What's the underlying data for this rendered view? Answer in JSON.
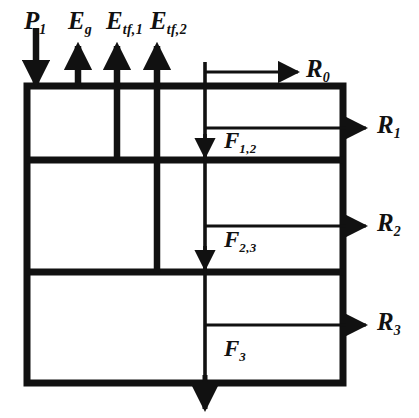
{
  "figure": {
    "type": "energy-balance-block-diagram",
    "stroke_color": "#111111",
    "background_color": "#ffffff"
  },
  "inputs": {
    "items": [
      {
        "id": "p1",
        "base": "P",
        "sub": "1",
        "direction": "down",
        "weight": "thick"
      },
      {
        "id": "eg",
        "base": "E",
        "sub": "g",
        "direction": "up",
        "weight": "thick"
      },
      {
        "id": "etf1",
        "base": "E",
        "sub": "tf,1",
        "direction": "up",
        "weight": "thick"
      },
      {
        "id": "etf2",
        "base": "E",
        "sub": "tf,2",
        "direction": "up",
        "weight": "thick"
      }
    ]
  },
  "outputs": {
    "items": [
      {
        "id": "r0",
        "base": "R",
        "sub": "0",
        "direction": "right"
      },
      {
        "id": "r1",
        "base": "R",
        "sub": "1",
        "direction": "right"
      },
      {
        "id": "r2",
        "base": "R",
        "sub": "2",
        "direction": "right"
      },
      {
        "id": "r3",
        "base": "R",
        "sub": "3",
        "direction": "right"
      }
    ]
  },
  "internal_fluxes": {
    "items": [
      {
        "id": "f12",
        "base": "F",
        "sub": "1,2",
        "direction": "down"
      },
      {
        "id": "f23",
        "base": "F",
        "sub": "2,3",
        "direction": "down"
      },
      {
        "id": "f3",
        "base": "F",
        "sub": "3",
        "direction": "down"
      }
    ]
  }
}
